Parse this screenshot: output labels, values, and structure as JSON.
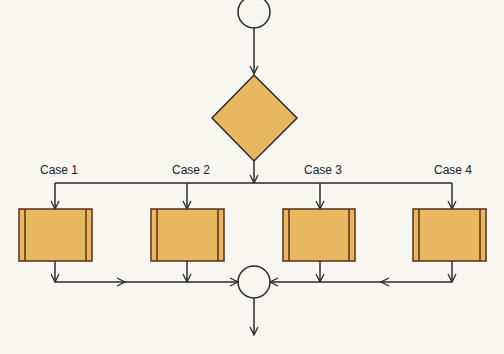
{
  "diagram": {
    "type": "switch-case flowchart",
    "colors": {
      "fill": "#e8b860",
      "stroke": "#2a2a2a",
      "box_border": "#5a2e1a",
      "background": "#f8f6f0"
    },
    "start_node": {
      "shape": "circle"
    },
    "decision_node": {
      "shape": "diamond"
    },
    "cases": [
      {
        "label": "Case 1"
      },
      {
        "label": "Case 2"
      },
      {
        "label": "Case 3"
      },
      {
        "label": "Case 4"
      }
    ],
    "merge_node": {
      "shape": "circle"
    }
  }
}
